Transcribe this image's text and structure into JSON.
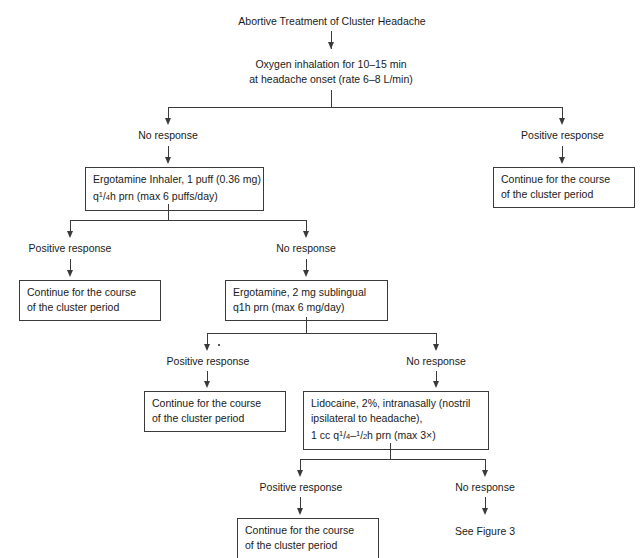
{
  "figure": {
    "title": "Abortive Treatment of Cluster Headache",
    "step1": {
      "line1": "Oxygen inhalation for 10–15 min",
      "line2": "at headache onset (rate 6–8 L/min)"
    },
    "level1": {
      "left_label": "No response",
      "right_label": "Positive response",
      "left_box": {
        "line1": "Ergotamine Inhaler, 1 puff (0.36 mg)",
        "line2_prefix": "q",
        "line2_num": "1",
        "line2_slash": "/",
        "line2_den": "4",
        "line2_suffix": "h prn (max 6 puffs/day)"
      },
      "right_box": {
        "line1": "Continue for the course",
        "line2": "of the cluster period"
      }
    },
    "level2": {
      "left_label": "Positive response",
      "right_label": "No response",
      "left_box": {
        "line1": "Continue for the course",
        "line2": "of the cluster period"
      },
      "right_box": {
        "line1": "Ergotamine, 2 mg sublingual",
        "line2": "q1h prn (max 6 mg/day)"
      }
    },
    "level3": {
      "left_label": "Positive response",
      "right_label": "No response",
      "left_box": {
        "line1": "Continue for the course",
        "line2": "of the cluster period"
      },
      "right_box": {
        "line1": "Lidocaine, 2%, intranasally (nostril",
        "line2": "ipsilateral to headache),",
        "line3_prefix": "1 cc q",
        "line3_num1": "1",
        "line3_slash1": "/",
        "line3_den1": "4",
        "line3_dash": "–",
        "line3_num2": "1",
        "line3_slash2": "/",
        "line3_den2": "2",
        "line3_suffix": "h prn (max 3×)"
      }
    },
    "level4": {
      "left_label": "Positive response",
      "right_label": "No response",
      "left_box": {
        "line1": "Continue for the course",
        "line2": "of the cluster period"
      },
      "right_text": "See Figure 3"
    }
  },
  "style": {
    "line_color": "#3a3a3a",
    "text_color": "#1a1a1a",
    "background": "#ffffff"
  }
}
